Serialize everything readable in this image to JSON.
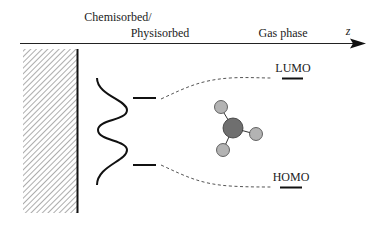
{
  "labels": {
    "chemisorbed": "Chemisorbed/",
    "physisorbed": "Physisorbed",
    "gas_phase": "Gas phase",
    "axis": "z",
    "lumo": "LUMO",
    "homo": "HOMO"
  },
  "colors": {
    "ink": "#111111",
    "hatch": "#8a8a8a",
    "dash": "#555555",
    "central_atom": "#6f6f6f",
    "outer_atom": "#b3b3b3"
  },
  "molecule": {
    "central_atoms": 1,
    "outer_atoms": 3
  }
}
